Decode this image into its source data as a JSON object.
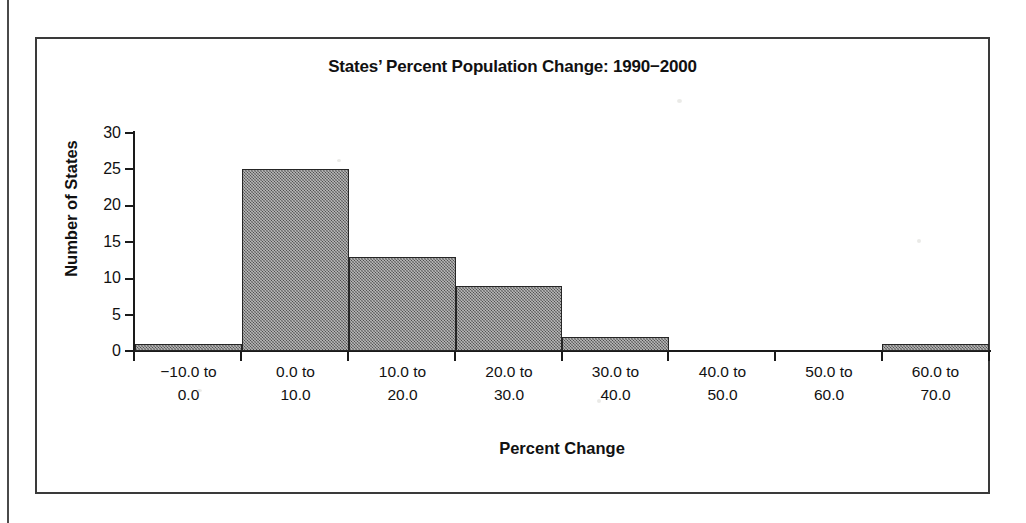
{
  "chart_data": {
    "type": "bar",
    "title": "States’ Percent Population Change: 1990−2000",
    "xlabel": "Percent Change",
    "ylabel": "Number of States",
    "categories": [
      "-10.0 to 0.0",
      "0.0 to 10.0",
      "10.0 to 20.0",
      "20.0 to 30.0",
      "30.0 to 40.0",
      "40.0 to 50.0",
      "50.0 to 60.0",
      "60.0 to 70.0"
    ],
    "category_lines": [
      [
        "−10.0 to",
        "0.0"
      ],
      [
        "0.0 to",
        "10.0"
      ],
      [
        "10.0 to",
        "20.0"
      ],
      [
        "20.0 to",
        "30.0"
      ],
      [
        "30.0 to",
        "40.0"
      ],
      [
        "40.0 to",
        "50.0"
      ],
      [
        "50.0 to",
        "60.0"
      ],
      [
        "60.0 to",
        "70.0"
      ]
    ],
    "values": [
      1,
      25,
      13,
      9,
      2,
      0,
      0,
      1
    ],
    "ylim": [
      0,
      30
    ],
    "ytick_labels": [
      "30",
      "25",
      "20",
      "15",
      "10",
      "5",
      "0"
    ],
    "ytick_values": [
      30,
      25,
      20,
      15,
      10,
      5,
      0
    ],
    "grid": false,
    "legend": false,
    "bar_color": "#6e6e6e",
    "bar_edge_color": "#262626",
    "axis_color": "#1a1a1a",
    "background_color": "#ffffff"
  }
}
